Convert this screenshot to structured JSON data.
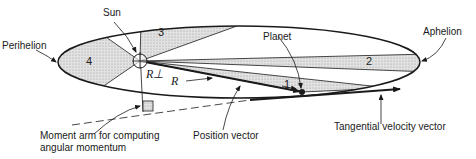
{
  "diagram": {
    "labels": {
      "sun": "Sun",
      "perihelion": "Perihelion",
      "aphelion": "Aphelion",
      "planet": "Planet",
      "position_vector": "Position vector",
      "tangential_velocity": "Tangential velocity vector",
      "moment_arm_line1": "Moment arm for computing",
      "moment_arm_line2": "angular momentum",
      "r": "R",
      "r_perp": "R⊥"
    },
    "sectors": [
      {
        "id": "1",
        "label": "1"
      },
      {
        "id": "2",
        "label": "2"
      },
      {
        "id": "3",
        "label": "3"
      },
      {
        "id": "4",
        "label": "4"
      }
    ],
    "colors": {
      "line": "#1a1a1a",
      "shade": "#d9d9d9",
      "background": "#ffffff"
    }
  }
}
